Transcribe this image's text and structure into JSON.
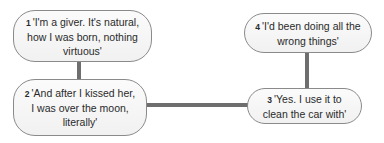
{
  "diagram": {
    "nodes": [
      {
        "number": "1",
        "text": "'I'm a giver. It's natural, how I was born, nothing virtuous'"
      },
      {
        "number": "2",
        "text": "'And after I kissed her, I was over the moon, literally'"
      },
      {
        "number": "3",
        "text": "'Yes. I use it to clean the car with'"
      },
      {
        "number": "4",
        "text": "'I'd been doing all the wrong things'"
      }
    ],
    "edges": [
      {
        "from": "1",
        "to": "2"
      },
      {
        "from": "2",
        "to": "3"
      },
      {
        "from": "3",
        "to": "4"
      }
    ],
    "colors": {
      "connector": "#6e6e6e",
      "node_border": "#8a8a8a",
      "node_fill": "#f5f5f5"
    }
  }
}
